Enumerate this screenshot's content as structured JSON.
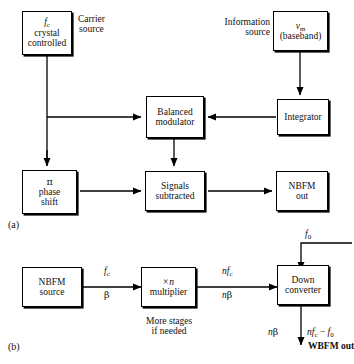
{
  "figure": {
    "panel_a_tag": "(a)",
    "panel_b_tag": "(b)"
  },
  "panel_a": {
    "boxes": [
      {
        "id": "carrier",
        "lines": [
          "fc",
          "crystal",
          "controlled"
        ]
      },
      {
        "id": "information",
        "lines": [
          "vm",
          "(baseband)"
        ]
      },
      {
        "id": "balanced_modulator",
        "lines": [
          "Balanced",
          "modulator"
        ]
      },
      {
        "id": "integrator",
        "lines": [
          "Integrator"
        ]
      },
      {
        "id": "phase_shift",
        "lines": [
          "π",
          "phase",
          "shift"
        ]
      },
      {
        "id": "signals_subtracted",
        "lines": [
          "Signals",
          "subtracted"
        ]
      },
      {
        "id": "nbfm_out",
        "lines": [
          "NBFM",
          "out"
        ]
      }
    ],
    "carrier_box_line1": "f",
    "carrier_box_sub1": "c",
    "carrier_box_line2": "crystal",
    "carrier_box_line3": "controlled",
    "carrier_label_line1": "Carrier",
    "carrier_label_line2": "source",
    "info_box_line1": "v",
    "info_box_sub1": "m",
    "info_box_line2": "(baseband)",
    "info_label_line1": "Information",
    "info_label_line2": "source",
    "balanced_line1": "Balanced",
    "balanced_line2": "modulator",
    "integrator_line1": "Integrator",
    "phase_line1": "π",
    "phase_line2": "phase",
    "phase_line3": "shift",
    "signals_line1": "Signals",
    "signals_line2": "subtracted",
    "nbfm_line1": "NBFM",
    "nbfm_line2": "out"
  },
  "panel_b": {
    "boxes": [
      {
        "id": "nbfm_source",
        "lines": [
          "NBFM",
          "source"
        ]
      },
      {
        "id": "multiplier",
        "lines": [
          "× n",
          "multiplier"
        ]
      },
      {
        "id": "down_converter",
        "lines": [
          "Down",
          "converter"
        ]
      }
    ],
    "nbfm_source_line1": "NBFM",
    "nbfm_source_line2": "source",
    "multiplier_line1_symbol": "×",
    "multiplier_line1_var": "n",
    "multiplier_line2": "multiplier",
    "down_line1": "Down",
    "down_line2": "converter",
    "note_line1": "More stages",
    "note_line2": "if needed",
    "sig_fc": "f",
    "sig_fc_sub": "c",
    "sig_beta": "β",
    "sig_nfc_n": "n",
    "sig_nfc_f": "f",
    "sig_nfc_sub": "c",
    "sig_nbeta_n": "n",
    "sig_nbeta_beta": "β",
    "sig_f0_f": "f",
    "sig_f0_sub": "0",
    "out_nbeta_n": "n",
    "out_nbeta_beta": "β",
    "out_expr_n": "n",
    "out_expr_f": "f",
    "out_expr_sub": "c",
    "out_expr_minus": "−",
    "out_expr_f0": "f",
    "out_expr_f0_sub": "0",
    "wbfm_out": "WBFM out"
  }
}
